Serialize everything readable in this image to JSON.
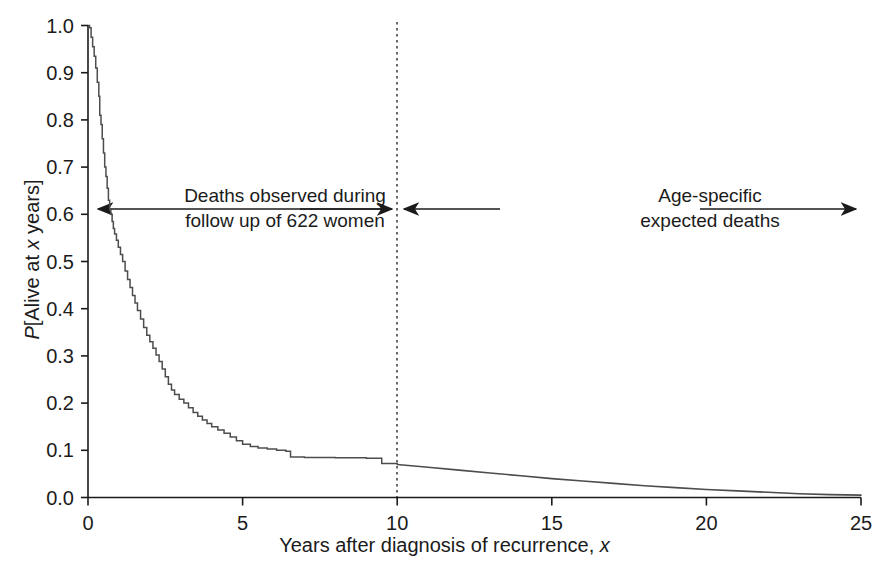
{
  "axes": {
    "y_title_parts": {
      "p": "P",
      "mid": "[Alive at ",
      "x": "x",
      "end": " years]"
    },
    "x_title_parts": {
      "main": "Years after diagnosis of recurrence, ",
      "x": "x"
    },
    "y_ticks": [
      "1.0",
      "0.9",
      "0.8",
      "0.7",
      "0.6",
      "0.5",
      "0.4",
      "0.3",
      "0.2",
      "0.1",
      "0.0"
    ],
    "x_ticks": [
      "0",
      "5",
      "10",
      "15",
      "20",
      "25"
    ]
  },
  "annotations": {
    "left_line1": "Deaths observed during",
    "left_line2": "follow up of 622 women",
    "right_line1": "Age-specific",
    "right_line2": "expected deaths"
  },
  "colors": {
    "curve": "#4d4d4d",
    "axis": "#1b1b1b",
    "annotation": "#1b1b1b",
    "divider": "#1b1b1b"
  },
  "chart_data": {
    "type": "line",
    "title": "",
    "xlabel": "Years after diagnosis of recurrence, x",
    "ylabel": "P[Alive at x years]",
    "xlim": [
      0,
      25
    ],
    "ylim": [
      0,
      1.0
    ],
    "xticks": [
      0,
      5,
      10,
      15,
      20,
      25
    ],
    "yticks": [
      0.0,
      0.1,
      0.2,
      0.3,
      0.4,
      0.5,
      0.6,
      0.7,
      0.8,
      0.9,
      1.0
    ],
    "grid": false,
    "legend": "none",
    "divider_x": 10,
    "annotations": [
      {
        "text": "Deaths observed during follow up of 622 women",
        "x_range": [
          0,
          10
        ],
        "y": 0.61,
        "arrow": "double-ended"
      },
      {
        "text": "Age-specific expected deaths",
        "x_range": [
          10,
          25
        ],
        "y": 0.61,
        "arrow": "double-ended"
      }
    ],
    "series": [
      {
        "name": "Observed Kaplan-Meier survival (0-10 years)",
        "style": "step",
        "points": [
          [
            0.0,
            1.0
          ],
          [
            0.05,
            0.995
          ],
          [
            0.1,
            0.975
          ],
          [
            0.15,
            0.955
          ],
          [
            0.2,
            0.935
          ],
          [
            0.25,
            0.91
          ],
          [
            0.3,
            0.88
          ],
          [
            0.35,
            0.85
          ],
          [
            0.38,
            0.81
          ],
          [
            0.42,
            0.79
          ],
          [
            0.46,
            0.76
          ],
          [
            0.5,
            0.73
          ],
          [
            0.54,
            0.7
          ],
          [
            0.58,
            0.68
          ],
          [
            0.62,
            0.655
          ],
          [
            0.66,
            0.63
          ],
          [
            0.7,
            0.612
          ],
          [
            0.74,
            0.6
          ],
          [
            0.78,
            0.585
          ],
          [
            0.82,
            0.57
          ],
          [
            0.86,
            0.558
          ],
          [
            0.92,
            0.545
          ],
          [
            0.98,
            0.53
          ],
          [
            1.05,
            0.515
          ],
          [
            1.12,
            0.5
          ],
          [
            1.2,
            0.48
          ],
          [
            1.28,
            0.462
          ],
          [
            1.36,
            0.445
          ],
          [
            1.44,
            0.428
          ],
          [
            1.52,
            0.412
          ],
          [
            1.6,
            0.396
          ],
          [
            1.7,
            0.378
          ],
          [
            1.8,
            0.36
          ],
          [
            1.9,
            0.344
          ],
          [
            2.0,
            0.33
          ],
          [
            2.1,
            0.316
          ],
          [
            2.2,
            0.302
          ],
          [
            2.3,
            0.288
          ],
          [
            2.4,
            0.272
          ],
          [
            2.5,
            0.256
          ],
          [
            2.6,
            0.24
          ],
          [
            2.7,
            0.228
          ],
          [
            2.8,
            0.218
          ],
          [
            2.95,
            0.208
          ],
          [
            3.1,
            0.2
          ],
          [
            3.25,
            0.19
          ],
          [
            3.4,
            0.18
          ],
          [
            3.55,
            0.172
          ],
          [
            3.7,
            0.164
          ],
          [
            3.85,
            0.157
          ],
          [
            4.0,
            0.15
          ],
          [
            4.2,
            0.143
          ],
          [
            4.4,
            0.136
          ],
          [
            4.6,
            0.128
          ],
          [
            4.8,
            0.12
          ],
          [
            5.0,
            0.113
          ],
          [
            5.25,
            0.108
          ],
          [
            5.5,
            0.105
          ],
          [
            5.8,
            0.103
          ],
          [
            6.1,
            0.1
          ],
          [
            6.4,
            0.098
          ],
          [
            6.55,
            0.086
          ],
          [
            7.0,
            0.085
          ],
          [
            7.5,
            0.085
          ],
          [
            8.0,
            0.084
          ],
          [
            8.5,
            0.084
          ],
          [
            9.0,
            0.083
          ],
          [
            9.4,
            0.083
          ],
          [
            9.5,
            0.072
          ],
          [
            10.0,
            0.071
          ]
        ]
      },
      {
        "name": "Age-specific expected survival (10-25 years)",
        "style": "smooth",
        "points": [
          [
            10.0,
            0.07
          ],
          [
            11.0,
            0.064
          ],
          [
            12.0,
            0.058
          ],
          [
            13.0,
            0.052
          ],
          [
            14.0,
            0.046
          ],
          [
            15.0,
            0.04
          ],
          [
            16.0,
            0.035
          ],
          [
            17.0,
            0.03
          ],
          [
            18.0,
            0.025
          ],
          [
            19.0,
            0.021
          ],
          [
            20.0,
            0.017
          ],
          [
            21.0,
            0.014
          ],
          [
            22.0,
            0.011
          ],
          [
            23.0,
            0.008
          ],
          [
            24.0,
            0.006
          ],
          [
            25.0,
            0.005
          ]
        ]
      }
    ]
  }
}
